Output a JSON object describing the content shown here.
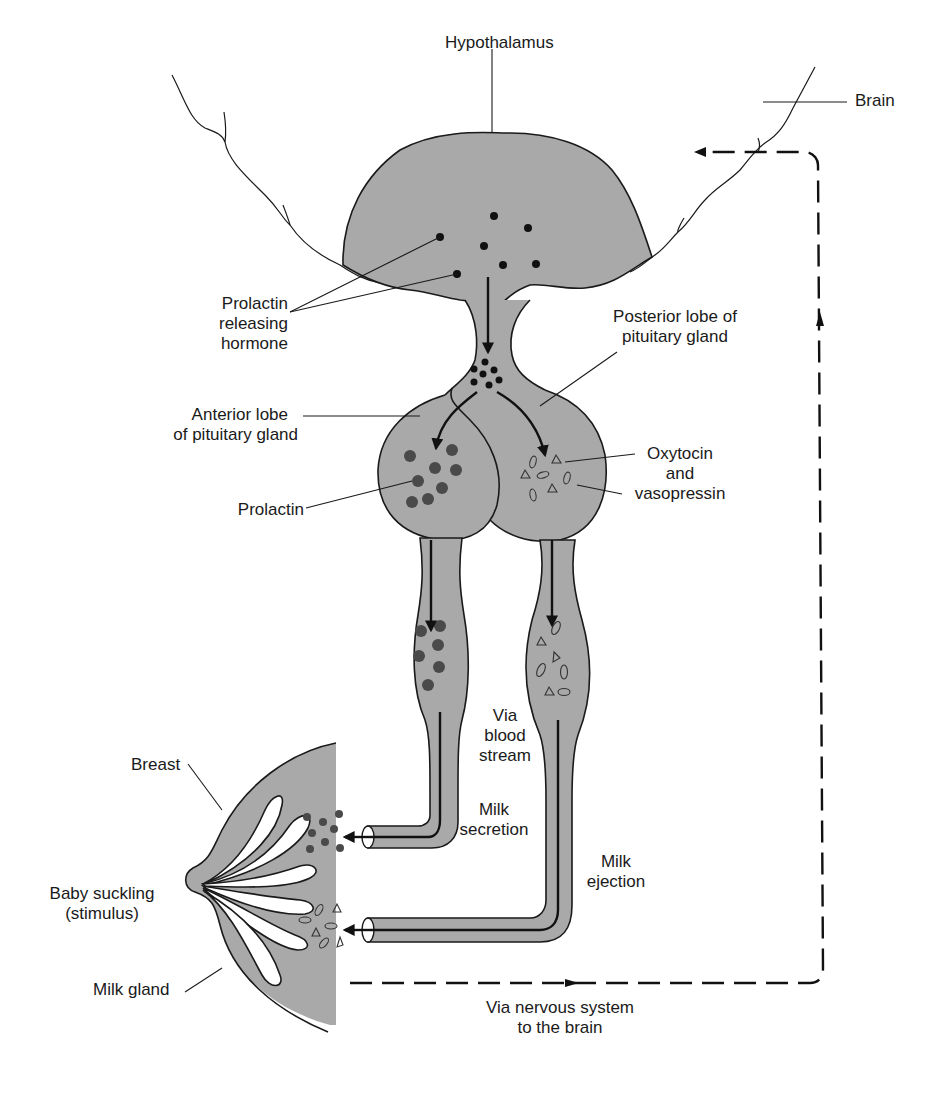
{
  "figure": {
    "fill_color": "#a9a9a9",
    "line_color": "#1a1a1a"
  },
  "labels": {
    "hypothalamus": "Hypothalamus",
    "brain": "Brain",
    "prolactin_releasing_hormone": [
      "Prolactin",
      "releasing",
      "hormone"
    ],
    "posterior_lobe": [
      "Posterior lobe of",
      "pituitary gland"
    ],
    "anterior_lobe": [
      "Anterior lobe",
      "of pituitary gland"
    ],
    "oxytocin_vasopressin": [
      "Oxytocin",
      "and",
      "vasopressin"
    ],
    "prolactin": "Prolactin",
    "via_blood_stream": [
      "Via",
      "blood",
      "stream"
    ],
    "breast": "Breast",
    "milk_secretion": [
      "Milk",
      "secretion"
    ],
    "milk_ejection": [
      "Milk",
      "ejection"
    ],
    "baby_suckling": [
      "Baby suckling",
      "(stimulus)"
    ],
    "milk_gland": "Milk gland",
    "via_nervous_system": [
      "Via nervous system",
      "to the brain"
    ]
  },
  "legend_symbols": {
    "prolactin_releasing_hormone": "small-black-dot",
    "prolactin": "large-dark-grey-dot",
    "oxytocin_vasopressin": "open-oval-and-triangle"
  },
  "pathways": {
    "hormonal": "solid-arrows",
    "neural_feedback": "dashed-arrow"
  }
}
